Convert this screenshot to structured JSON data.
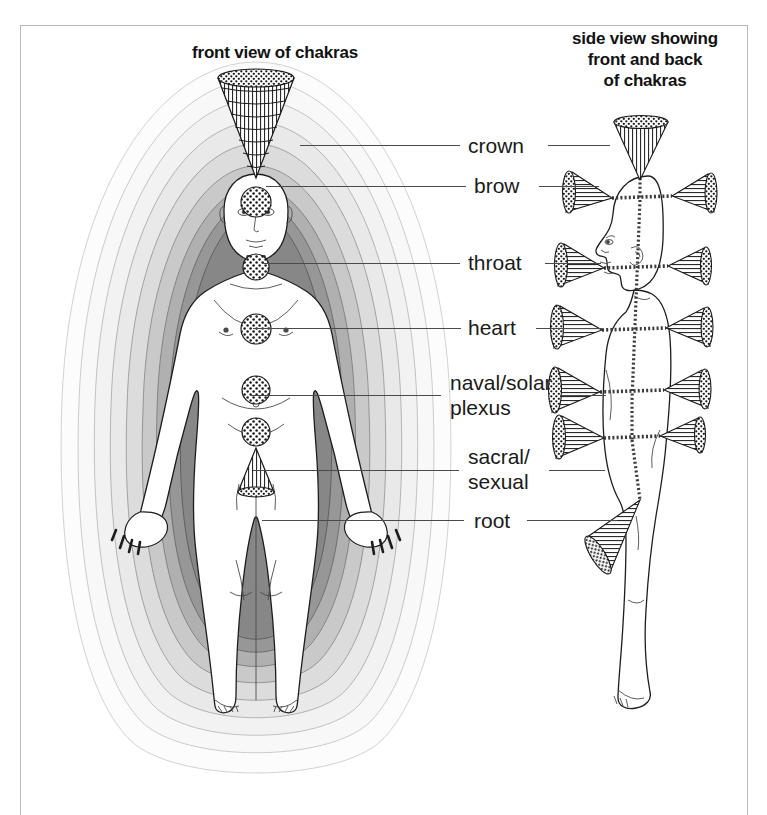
{
  "figure": {
    "kind": "anatomical-chakra-diagram",
    "background": "#ffffff",
    "frame_color": "#b9b9b9"
  },
  "titles": {
    "left": "front view of chakras",
    "right": "side view showing\nfront and back\nof chakras"
  },
  "labels": [
    {
      "id": "crown",
      "text": "crown",
      "x": 468,
      "y": 133,
      "left_leader": {
        "x": 300,
        "w": 160,
        "y": 145
      },
      "right_leader": {
        "x": 548,
        "w": 62,
        "y": 145
      }
    },
    {
      "id": "brow",
      "text": "brow",
      "x": 474,
      "y": 173,
      "left_leader": {
        "x": 266,
        "w": 200,
        "y": 186
      },
      "right_leader": {
        "x": 539,
        "w": 60,
        "y": 186
      }
    },
    {
      "id": "throat",
      "text": "throat",
      "x": 468,
      "y": 250,
      "left_leader": {
        "x": 262,
        "w": 198,
        "y": 263
      },
      "right_leader": {
        "x": 545,
        "w": 56,
        "y": 263
      }
    },
    {
      "id": "heart",
      "text": "heart",
      "x": 468,
      "y": 315,
      "left_leader": {
        "x": 253,
        "w": 208,
        "y": 328
      },
      "right_leader": {
        "x": 536,
        "w": 66,
        "y": 328
      }
    },
    {
      "id": "naval",
      "text": "naval/solar\nplexus",
      "x": 450,
      "y": 370,
      "left_leader": {
        "x": 251,
        "w": 190,
        "y": 395
      },
      "right_leader": {
        "x": 560,
        "w": 46,
        "y": 395
      }
    },
    {
      "id": "sacral",
      "text": "sacral/\nsexual",
      "x": 468,
      "y": 444,
      "left_leader": {
        "x": 253,
        "w": 206,
        "y": 470
      },
      "right_leader": {
        "x": 549,
        "w": 56,
        "y": 470
      }
    },
    {
      "id": "root",
      "text": "root",
      "x": 474,
      "y": 508,
      "left_leader": {
        "x": 262,
        "w": 202,
        "y": 520
      },
      "right_leader": {
        "x": 527,
        "w": 90,
        "y": 520
      }
    }
  ],
  "front_view": {
    "aura_bands": [
      {
        "index": 0,
        "color": "#fbfbfb",
        "stroke": "#cfcfcf"
      },
      {
        "index": 1,
        "color": "#f6f6f6",
        "stroke": "#c8c8c8"
      },
      {
        "index": 2,
        "color": "#efefef",
        "stroke": "#bcbcbc"
      },
      {
        "index": 3,
        "color": "#e4e4e4",
        "stroke": "#ababab"
      },
      {
        "index": 4,
        "color": "#d3d3d3",
        "stroke": "#9a9a9a"
      },
      {
        "index": 5,
        "color": "#bdbdbd",
        "stroke": "#8a8a8a"
      },
      {
        "index": 6,
        "color": "#a2a2a2",
        "stroke": "#777777"
      },
      {
        "index": 7,
        "color": "#8a8a8a",
        "stroke": "#666666"
      }
    ],
    "body_fill": "#ffffff",
    "body_stroke": "#1d1d1d",
    "chakras": [
      {
        "name": "crown",
        "type": "cone-up",
        "cx": 256,
        "cy": 150
      },
      {
        "name": "brow",
        "type": "disc",
        "cx": 256,
        "cy": 202,
        "r": 14
      },
      {
        "name": "throat",
        "type": "disc",
        "cx": 256,
        "cy": 267,
        "r": 13
      },
      {
        "name": "heart",
        "type": "disc",
        "cx": 256,
        "cy": 329,
        "r": 15
      },
      {
        "name": "naval",
        "type": "disc",
        "cx": 256,
        "cy": 390,
        "r": 14
      },
      {
        "name": "sacral",
        "type": "disc",
        "cx": 256,
        "cy": 432,
        "r": 14
      },
      {
        "name": "root",
        "type": "cone-down",
        "cx": 256,
        "cy": 470
      }
    ]
  },
  "side_view": {
    "body_stroke": "#1d1d1d",
    "central_channel": "dashed-vertical",
    "chakra_pairs": [
      {
        "name": "crown",
        "front": false,
        "back": false,
        "top_cone": true,
        "y": 128
      },
      {
        "name": "brow",
        "front": true,
        "back": true,
        "y": 196
      },
      {
        "name": "throat",
        "front": true,
        "back": true,
        "y": 268
      },
      {
        "name": "heart",
        "front": true,
        "back": true,
        "y": 330
      },
      {
        "name": "naval",
        "front": true,
        "back": true,
        "y": 392
      },
      {
        "name": "sacral",
        "front": true,
        "back": true,
        "y": 440
      },
      {
        "name": "root",
        "front": false,
        "back": true,
        "y": 500,
        "direction": "down-forward"
      }
    ]
  }
}
